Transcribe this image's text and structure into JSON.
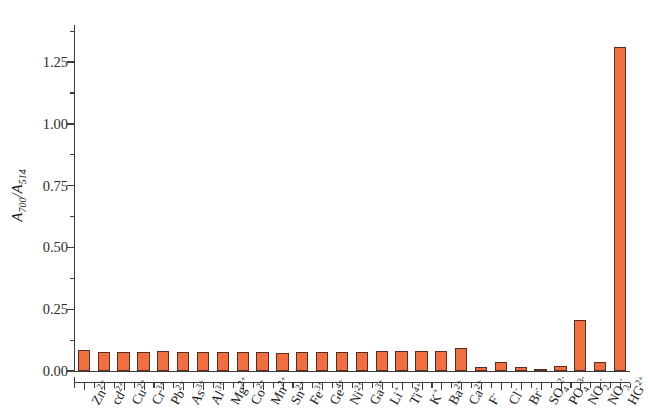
{
  "chart_data": {
    "type": "bar",
    "title": "",
    "xlabel": "",
    "ylabel": "A700/A514",
    "ylabel_parts": {
      "num_base": "A",
      "num_sub": "700",
      "den_base": "A",
      "den_sub": "514"
    },
    "ylim": [
      0.0,
      1.4
    ],
    "yticks": [
      0.0,
      0.25,
      0.5,
      0.75,
      1.0,
      1.25
    ],
    "ytick_labels": [
      "0.00",
      "0.25",
      "0.50",
      "0.75",
      "1.00",
      "1.25"
    ],
    "yminor_ticks": [
      0.125,
      0.375,
      0.625,
      0.875,
      1.125,
      1.375
    ],
    "grid": false,
    "legend": "none",
    "categories": [
      "Zn2+",
      "cd2+",
      "Cu2+",
      "Cr3+",
      "Pb2+",
      "As3+",
      "Al3+",
      "Mg2+",
      "Co2+",
      "Mn2+",
      "Sn2+",
      "Fe3+",
      "Ge4+",
      "Ni2+",
      "Ga3+",
      "Li+",
      "Ti4+",
      "K+",
      "Ba2+",
      "Ca2+",
      "F-",
      "Cl-",
      "Br-",
      "SO42-",
      "PO43-",
      "NO2-",
      "NO3-",
      "HG2+"
    ],
    "category_labels": [
      {
        "base": "Zn",
        "sup": "2+",
        "sub": ""
      },
      {
        "base": "cd",
        "sup": "2+",
        "sub": ""
      },
      {
        "base": "Cu",
        "sup": "2+",
        "sub": ""
      },
      {
        "base": "Cr",
        "sup": "3+",
        "sub": ""
      },
      {
        "base": "Pb",
        "sup": "2+",
        "sub": ""
      },
      {
        "base": "As",
        "sup": "3+",
        "sub": ""
      },
      {
        "base": "Al",
        "sup": "3+",
        "sub": ""
      },
      {
        "base": "Mg",
        "sup": "2+",
        "sub": ""
      },
      {
        "base": "Co",
        "sup": "2+",
        "sub": ""
      },
      {
        "base": "Mn",
        "sup": "2+",
        "sub": ""
      },
      {
        "base": "Sn",
        "sup": "2+",
        "sub": ""
      },
      {
        "base": "Fe",
        "sup": "3+",
        "sub": ""
      },
      {
        "base": "Ge",
        "sup": "4+",
        "sub": ""
      },
      {
        "base": "Ni",
        "sup": "2+",
        "sub": ""
      },
      {
        "base": "Ga",
        "sup": "3+",
        "sub": ""
      },
      {
        "base": "Li",
        "sup": "+",
        "sub": ""
      },
      {
        "base": "Ti",
        "sup": "4+",
        "sub": ""
      },
      {
        "base": "K",
        "sup": "+",
        "sub": ""
      },
      {
        "base": "Ba",
        "sup": "2+",
        "sub": ""
      },
      {
        "base": "Ca",
        "sup": "2+",
        "sub": ""
      },
      {
        "base": "F",
        "sup": "-",
        "sub": ""
      },
      {
        "base": "Cl",
        "sup": "-",
        "sub": ""
      },
      {
        "base": "Br",
        "sup": "-",
        "sub": ""
      },
      {
        "base": "SO",
        "sup": "2-",
        "sub": "4"
      },
      {
        "base": "PO",
        "sup": "3-",
        "sub": "4"
      },
      {
        "base": "NO",
        "sup": "-",
        "sub": "2"
      },
      {
        "base": "NO",
        "sup": "-",
        "sub": "3"
      },
      {
        "base": "HG",
        "sup": "2+",
        "sub": ""
      }
    ],
    "values": [
      0.085,
      0.075,
      0.075,
      0.075,
      0.082,
      0.075,
      0.075,
      0.075,
      0.078,
      0.075,
      0.072,
      0.078,
      0.075,
      0.075,
      0.078,
      0.08,
      0.08,
      0.08,
      0.08,
      0.092,
      0.017,
      0.036,
      0.018,
      0.007,
      0.021,
      0.208,
      0.035,
      1.31
    ],
    "bar_color": "#ef6f42",
    "bar_edge_color": "#5a2d20"
  }
}
